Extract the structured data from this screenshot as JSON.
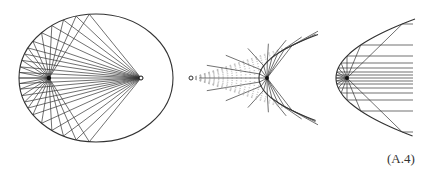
{
  "figure": {
    "label": "(A.4)",
    "stroke_color": "#333333",
    "dashed_color": "#aaaaaa",
    "panels": [
      {
        "name": "ellipse-reflection",
        "ellipse": {
          "cx": 96,
          "cy": 78,
          "rx": 77,
          "ry": 64
        },
        "focus_left": [
          49,
          78
        ],
        "focus_right": [
          141,
          78
        ],
        "ray_angles_deg": [
          95,
          105,
          115,
          125,
          135,
          145,
          152,
          158,
          164,
          170,
          175,
          180,
          185,
          190,
          196,
          202,
          208,
          215,
          225,
          235,
          245,
          255,
          265
        ]
      },
      {
        "name": "hyperbola-like-source-to-parabola",
        "source_point": [
          191,
          78
        ],
        "parabola": {
          "vertex": [
            259,
            78
          ],
          "focal_param": 8,
          "x_max": 318
        },
        "focus": [
          267,
          78
        ],
        "ray_count": 17
      },
      {
        "name": "parabola-collimation",
        "parabola": {
          "vertex": [
            336,
            78
          ],
          "focal_param": 11,
          "x_max": 415
        },
        "focus": [
          347,
          78
        ],
        "ray_offsets": [
          -54,
          -33,
          -22,
          -15,
          -10,
          -6,
          -3,
          0,
          3,
          6,
          10,
          15,
          22,
          33,
          54
        ],
        "ray_end_x": 413
      }
    ]
  }
}
